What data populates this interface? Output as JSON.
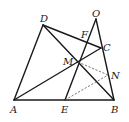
{
  "points": {
    "A": {
      "label": "A",
      "x": 14,
      "y": 100
    },
    "B": {
      "label": "B",
      "x": 114,
      "y": 100
    },
    "E": {
      "label": "E",
      "x": 65,
      "y": 100
    },
    "D": {
      "label": "D",
      "x": 43,
      "y": 25
    },
    "O": {
      "label": "O",
      "x": 96,
      "y": 19
    },
    "C": {
      "label": "C",
      "x": 101,
      "y": 48
    },
    "M": {
      "label": "M",
      "x": 78,
      "y": 62
    },
    "N": {
      "label": "N",
      "x": 108,
      "y": 75
    },
    "F": {
      "label": "F",
      "x": 88,
      "y": 37
    }
  },
  "segments_solid": [
    "AD",
    "AB",
    "DC",
    "DB",
    "AC",
    "OB",
    "OE"
  ],
  "segments_dashed": [
    "EN",
    "MN"
  ],
  "colors": {
    "stroke": "#1a1a1a",
    "dashed": "#555555"
  }
}
